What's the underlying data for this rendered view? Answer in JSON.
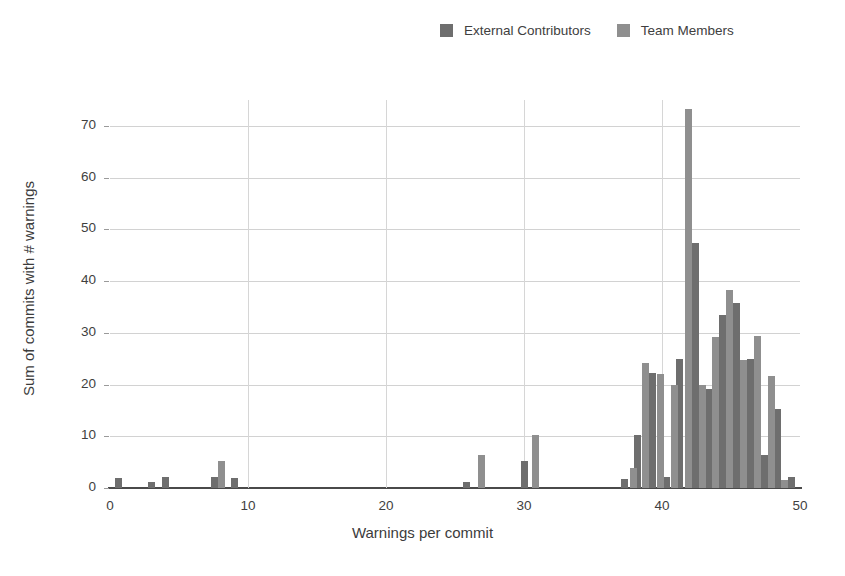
{
  "chart_data": {
    "type": "bar",
    "title": "",
    "subtitle": "",
    "xlabel": "Warnings per commit",
    "ylabel": "Sum of commits with # warnings",
    "xlim": [
      0,
      50
    ],
    "ylim": [
      0,
      75
    ],
    "xticks": [
      0,
      10,
      20,
      30,
      40,
      50
    ],
    "yticks": [
      0,
      10,
      20,
      30,
      40,
      50,
      60,
      70
    ],
    "grid": "horizontal-and-vertical",
    "legend_position": "top-center",
    "colors": {
      "external_contributors": "#6e6e6e",
      "team_members": "#8f8f8f",
      "gridline": "#d2d2d2",
      "axis": "#4a4a4a",
      "text": "#3c3c3c",
      "background": "#ffffff"
    },
    "series": [
      {
        "name": "External Contributors",
        "color": "#6e6e6e",
        "points": [
          {
            "x": 0.6,
            "y": 2.0
          },
          {
            "x": 3.0,
            "y": 1.2
          },
          {
            "x": 4.0,
            "y": 2.2
          },
          {
            "x": 7.6,
            "y": 2.2
          },
          {
            "x": 9.0,
            "y": 2.0
          },
          {
            "x": 25.8,
            "y": 1.2
          },
          {
            "x": 30.0,
            "y": 5.2
          },
          {
            "x": 37.3,
            "y": 1.8
          },
          {
            "x": 38.2,
            "y": 10.2
          },
          {
            "x": 39.3,
            "y": 22.3
          },
          {
            "x": 40.3,
            "y": 2.2
          },
          {
            "x": 41.3,
            "y": 25.0
          },
          {
            "x": 42.4,
            "y": 47.3
          },
          {
            "x": 43.4,
            "y": 19.2
          },
          {
            "x": 44.4,
            "y": 33.4
          },
          {
            "x": 45.4,
            "y": 35.8
          },
          {
            "x": 46.4,
            "y": 25.0
          },
          {
            "x": 47.4,
            "y": 6.4
          },
          {
            "x": 48.4,
            "y": 15.2
          },
          {
            "x": 49.4,
            "y": 2.1
          }
        ]
      },
      {
        "name": "Team Members",
        "color": "#8f8f8f",
        "points": [
          {
            "x": 8.1,
            "y": 5.2
          },
          {
            "x": 26.9,
            "y": 6.4
          },
          {
            "x": 30.8,
            "y": 10.2
          },
          {
            "x": 37.9,
            "y": 3.9
          },
          {
            "x": 38.8,
            "y": 24.2
          },
          {
            "x": 39.9,
            "y": 22.1
          },
          {
            "x": 40.9,
            "y": 20.0
          },
          {
            "x": 41.9,
            "y": 73.3
          },
          {
            "x": 42.9,
            "y": 19.9
          },
          {
            "x": 43.9,
            "y": 29.2
          },
          {
            "x": 44.9,
            "y": 38.3
          },
          {
            "x": 45.9,
            "y": 24.8
          },
          {
            "x": 46.9,
            "y": 29.3
          },
          {
            "x": 47.9,
            "y": 21.6
          },
          {
            "x": 48.9,
            "y": 1.6
          }
        ]
      }
    ]
  },
  "legend": {
    "items": [
      {
        "label": "External Contributors",
        "color": "#6e6e6e",
        "icon": "square-swatch-icon"
      },
      {
        "label": "Team Members",
        "color": "#8f8f8f",
        "icon": "square-swatch-icon"
      }
    ]
  },
  "axes": {
    "x": {
      "label": "Warnings per commit",
      "ticks": [
        "0",
        "10",
        "20",
        "30",
        "40",
        "50"
      ]
    },
    "y": {
      "label": "Sum of commits with # warnings",
      "ticks": [
        "0",
        "10",
        "20",
        "30",
        "40",
        "50",
        "60",
        "70"
      ]
    }
  }
}
